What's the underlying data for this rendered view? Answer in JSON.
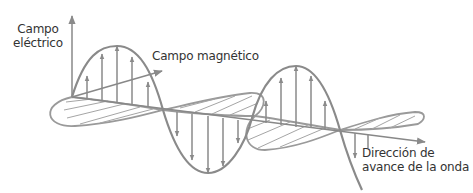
{
  "labels": {
    "electric_field": [
      "Campo",
      "eléctrico"
    ],
    "magnetic_field": "Campo magnético",
    "direction": [
      "Dirección de",
      "avance de la onda"
    ]
  },
  "colors": {
    "stroke": "#8a8a8a",
    "text": "#333333",
    "background": "#ffffff"
  }
}
